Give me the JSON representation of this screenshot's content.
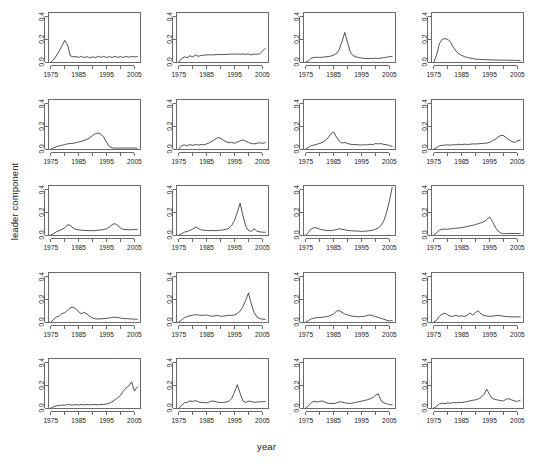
{
  "figure": {
    "xlabel": "year",
    "ylabel": "leader component",
    "rows": 5,
    "cols": 4
  },
  "chart_data": {
    "type": "line",
    "title": "",
    "subtitle": "",
    "xlabel": "year",
    "ylabel": "leader component",
    "layout": {
      "rows": 5,
      "cols": 4,
      "panels": 20,
      "grid": false,
      "legend": "none",
      "shared_axes": true
    },
    "xlim": [
      1974,
      2007
    ],
    "ylim": [
      0.0,
      0.44
    ],
    "xticks": [
      1975,
      1985,
      1995,
      2005
    ],
    "xticks_minor": [
      1980,
      1990,
      2000
    ],
    "xtick_labels": [
      "1975",
      "1985",
      "1995",
      "2005"
    ],
    "yticks": [
      0.0,
      0.2,
      0.4
    ],
    "ytick_labels": [
      "0.0",
      "0.2",
      "0.4"
    ],
    "x": [
      1975,
      1976,
      1977,
      1978,
      1979,
      1980,
      1981,
      1982,
      1983,
      1984,
      1985,
      1986,
      1987,
      1988,
      1989,
      1990,
      1991,
      1992,
      1993,
      1994,
      1995,
      1996,
      1997,
      1998,
      1999,
      2000,
      2001,
      2002,
      2003,
      2004,
      2005,
      2006
    ],
    "series": [
      {
        "name": "panel-1",
        "row": 1,
        "col": 1,
        "values": [
          0.0,
          0.02,
          0.055,
          0.095,
          0.14,
          0.19,
          0.15,
          0.055,
          0.045,
          0.048,
          0.04,
          0.05,
          0.038,
          0.048,
          0.036,
          0.046,
          0.038,
          0.05,
          0.04,
          0.05,
          0.038,
          0.048,
          0.04,
          0.05,
          0.04,
          0.048,
          0.04,
          0.05,
          0.042,
          0.048,
          0.045,
          0.048
        ]
      },
      {
        "name": "panel-2",
        "row": 1,
        "col": 2,
        "values": [
          0.0,
          0.03,
          0.045,
          0.038,
          0.055,
          0.045,
          0.062,
          0.05,
          0.058,
          0.06,
          0.062,
          0.063,
          0.062,
          0.064,
          0.065,
          0.066,
          0.066,
          0.067,
          0.068,
          0.069,
          0.07,
          0.07,
          0.068,
          0.07,
          0.068,
          0.072,
          0.062,
          0.07,
          0.068,
          0.072,
          0.095,
          0.12
        ]
      },
      {
        "name": "panel-3",
        "row": 1,
        "col": 3,
        "values": [
          0.0,
          0.01,
          0.035,
          0.04,
          0.042,
          0.04,
          0.042,
          0.045,
          0.048,
          0.052,
          0.06,
          0.075,
          0.11,
          0.18,
          0.26,
          0.17,
          0.085,
          0.055,
          0.045,
          0.04,
          0.035,
          0.032,
          0.03,
          0.032,
          0.03,
          0.034,
          0.03,
          0.035,
          0.038,
          0.042,
          0.048,
          0.05
        ]
      },
      {
        "name": "panel-4",
        "row": 1,
        "col": 4,
        "values": [
          0.0,
          0.06,
          0.16,
          0.2,
          0.205,
          0.2,
          0.175,
          0.13,
          0.095,
          0.072,
          0.058,
          0.048,
          0.04,
          0.035,
          0.03,
          0.026,
          0.024,
          0.022,
          0.021,
          0.02,
          0.019,
          0.018,
          0.018,
          0.017,
          0.017,
          0.016,
          0.016,
          0.015,
          0.015,
          0.014,
          0.014,
          0.013
        ]
      },
      {
        "name": "panel-5",
        "row": 2,
        "col": 1,
        "values": [
          0.0,
          0.01,
          0.02,
          0.028,
          0.032,
          0.04,
          0.045,
          0.048,
          0.05,
          0.055,
          0.062,
          0.068,
          0.075,
          0.085,
          0.1,
          0.118,
          0.135,
          0.14,
          0.13,
          0.105,
          0.06,
          0.022,
          0.01,
          0.008,
          0.008,
          0.008,
          0.008,
          0.008,
          0.008,
          0.008,
          0.008,
          0.008
        ]
      },
      {
        "name": "panel-6",
        "row": 2,
        "col": 2,
        "values": [
          0.0,
          0.03,
          0.035,
          0.03,
          0.038,
          0.032,
          0.04,
          0.034,
          0.04,
          0.036,
          0.045,
          0.055,
          0.07,
          0.085,
          0.1,
          0.095,
          0.078,
          0.062,
          0.055,
          0.058,
          0.05,
          0.062,
          0.072,
          0.08,
          0.07,
          0.058,
          0.048,
          0.045,
          0.05,
          0.055,
          0.05,
          0.055
        ]
      },
      {
        "name": "panel-7",
        "row": 2,
        "col": 3,
        "values": [
          0.0,
          0.015,
          0.03,
          0.035,
          0.042,
          0.05,
          0.058,
          0.075,
          0.1,
          0.135,
          0.15,
          0.105,
          0.07,
          0.052,
          0.058,
          0.048,
          0.042,
          0.038,
          0.04,
          0.036,
          0.035,
          0.038,
          0.036,
          0.042,
          0.038,
          0.048,
          0.045,
          0.048,
          0.04,
          0.038,
          0.03,
          0.022
        ]
      },
      {
        "name": "panel-8",
        "row": 2,
        "col": 4,
        "values": [
          0.0,
          0.012,
          0.028,
          0.032,
          0.035,
          0.036,
          0.034,
          0.038,
          0.036,
          0.042,
          0.038,
          0.042,
          0.04,
          0.042,
          0.045,
          0.044,
          0.046,
          0.048,
          0.05,
          0.052,
          0.058,
          0.072,
          0.085,
          0.105,
          0.12,
          0.118,
          0.1,
          0.08,
          0.065,
          0.058,
          0.072,
          0.078
        ]
      },
      {
        "name": "panel-9",
        "row": 3,
        "col": 1,
        "values": [
          0.0,
          0.012,
          0.028,
          0.038,
          0.05,
          0.062,
          0.09,
          0.085,
          0.062,
          0.05,
          0.045,
          0.042,
          0.04,
          0.04,
          0.038,
          0.038,
          0.04,
          0.042,
          0.045,
          0.048,
          0.055,
          0.07,
          0.092,
          0.1,
          0.085,
          0.062,
          0.05,
          0.048,
          0.046,
          0.046,
          0.048,
          0.05
        ]
      },
      {
        "name": "panel-10",
        "row": 3,
        "col": 2,
        "values": [
          0.0,
          0.01,
          0.025,
          0.032,
          0.04,
          0.052,
          0.07,
          0.058,
          0.045,
          0.042,
          0.04,
          0.038,
          0.04,
          0.038,
          0.04,
          0.042,
          0.045,
          0.05,
          0.06,
          0.085,
          0.13,
          0.2,
          0.28,
          0.17,
          0.08,
          0.04,
          0.032,
          0.055,
          0.035,
          0.028,
          0.025,
          0.024
        ]
      },
      {
        "name": "panel-11",
        "row": 3,
        "col": 3,
        "values": [
          0.0,
          0.025,
          0.055,
          0.065,
          0.06,
          0.052,
          0.045,
          0.042,
          0.038,
          0.04,
          0.042,
          0.048,
          0.055,
          0.05,
          0.045,
          0.04,
          0.038,
          0.036,
          0.035,
          0.034,
          0.032,
          0.033,
          0.035,
          0.038,
          0.042,
          0.05,
          0.062,
          0.085,
          0.125,
          0.2,
          0.3,
          0.42
        ]
      },
      {
        "name": "panel-12",
        "row": 3,
        "col": 4,
        "values": [
          0.0,
          0.02,
          0.042,
          0.05,
          0.052,
          0.05,
          0.055,
          0.058,
          0.06,
          0.062,
          0.065,
          0.07,
          0.075,
          0.08,
          0.085,
          0.092,
          0.1,
          0.108,
          0.118,
          0.135,
          0.16,
          0.12,
          0.07,
          0.035,
          0.018,
          0.012,
          0.012,
          0.014,
          0.013,
          0.014,
          0.013,
          0.014
        ]
      },
      {
        "name": "panel-13",
        "row": 4,
        "col": 1,
        "values": [
          0.0,
          0.02,
          0.045,
          0.05,
          0.075,
          0.08,
          0.105,
          0.125,
          0.13,
          0.115,
          0.09,
          0.072,
          0.085,
          0.07,
          0.05,
          0.035,
          0.028,
          0.026,
          0.028,
          0.03,
          0.032,
          0.035,
          0.04,
          0.042,
          0.04,
          0.035,
          0.03,
          0.03,
          0.028,
          0.026,
          0.025,
          0.024
        ]
      },
      {
        "name": "panel-14",
        "row": 4,
        "col": 2,
        "values": [
          0.0,
          0.018,
          0.038,
          0.048,
          0.055,
          0.06,
          0.065,
          0.062,
          0.058,
          0.06,
          0.062,
          0.055,
          0.05,
          0.055,
          0.058,
          0.05,
          0.052,
          0.055,
          0.058,
          0.06,
          0.062,
          0.075,
          0.095,
          0.135,
          0.19,
          0.255,
          0.16,
          0.085,
          0.045,
          0.03,
          0.025,
          0.022
        ]
      },
      {
        "name": "panel-15",
        "row": 4,
        "col": 3,
        "values": [
          0.0,
          0.012,
          0.028,
          0.035,
          0.038,
          0.04,
          0.042,
          0.045,
          0.05,
          0.058,
          0.072,
          0.095,
          0.1,
          0.085,
          0.07,
          0.062,
          0.055,
          0.05,
          0.048,
          0.045,
          0.048,
          0.05,
          0.058,
          0.062,
          0.055,
          0.048,
          0.04,
          0.032,
          0.025,
          0.015,
          0.01,
          0.012
        ]
      },
      {
        "name": "panel-16",
        "row": 4,
        "col": 4,
        "values": [
          0.0,
          0.015,
          0.05,
          0.07,
          0.078,
          0.062,
          0.05,
          0.052,
          0.058,
          0.05,
          0.055,
          0.048,
          0.06,
          0.08,
          0.06,
          0.085,
          0.098,
          0.07,
          0.058,
          0.052,
          0.05,
          0.052,
          0.055,
          0.058,
          0.055,
          0.05,
          0.048,
          0.046,
          0.045,
          0.045,
          0.045,
          0.046
        ]
      },
      {
        "name": "panel-17",
        "row": 5,
        "col": 1,
        "values": [
          0.0,
          0.01,
          0.02,
          0.022,
          0.026,
          0.024,
          0.03,
          0.028,
          0.026,
          0.03,
          0.026,
          0.032,
          0.028,
          0.03,
          0.028,
          0.03,
          0.03,
          0.028,
          0.03,
          0.032,
          0.035,
          0.042,
          0.055,
          0.072,
          0.09,
          0.11,
          0.15,
          0.175,
          0.195,
          0.23,
          0.15,
          0.185
        ]
      },
      {
        "name": "panel-18",
        "row": 5,
        "col": 2,
        "values": [
          0.0,
          0.022,
          0.045,
          0.05,
          0.062,
          0.058,
          0.065,
          0.055,
          0.048,
          0.05,
          0.045,
          0.055,
          0.062,
          0.058,
          0.05,
          0.048,
          0.05,
          0.052,
          0.06,
          0.085,
          0.14,
          0.205,
          0.13,
          0.062,
          0.048,
          0.06,
          0.058,
          0.05,
          0.052,
          0.055,
          0.055,
          0.058
        ]
      },
      {
        "name": "panel-19",
        "row": 5,
        "col": 3,
        "values": [
          0.0,
          0.02,
          0.048,
          0.06,
          0.052,
          0.058,
          0.062,
          0.05,
          0.042,
          0.04,
          0.038,
          0.045,
          0.055,
          0.052,
          0.045,
          0.042,
          0.04,
          0.045,
          0.05,
          0.055,
          0.06,
          0.065,
          0.072,
          0.08,
          0.09,
          0.112,
          0.125,
          0.065,
          0.045,
          0.038,
          0.03,
          0.028
        ]
      },
      {
        "name": "panel-20",
        "row": 5,
        "col": 4,
        "values": [
          0.0,
          0.015,
          0.035,
          0.042,
          0.038,
          0.045,
          0.042,
          0.048,
          0.045,
          0.05,
          0.048,
          0.052,
          0.058,
          0.062,
          0.068,
          0.072,
          0.08,
          0.095,
          0.12,
          0.165,
          0.12,
          0.085,
          0.075,
          0.07,
          0.065,
          0.062,
          0.078,
          0.082,
          0.07,
          0.062,
          0.058,
          0.068
        ]
      }
    ]
  }
}
